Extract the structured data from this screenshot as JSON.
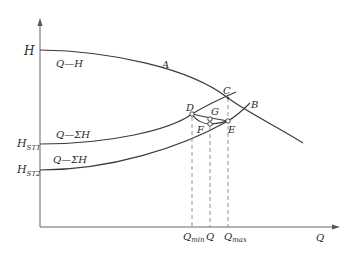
{
  "diagram": {
    "axes": {
      "y_label": "H",
      "x_label": "Q"
    },
    "y_ticks": [
      {
        "id": "h",
        "main": "H",
        "sub": ""
      },
      {
        "id": "hst1",
        "main": "H",
        "sub": "ST1"
      },
      {
        "id": "hst2",
        "main": "H",
        "sub": "ST2"
      }
    ],
    "x_ticks": [
      {
        "id": "qmin",
        "main": "Q",
        "sub": "min"
      },
      {
        "id": "q",
        "main": "Q",
        "sub": ""
      },
      {
        "id": "qmax",
        "main": "Q",
        "sub": "max"
      }
    ],
    "curves": [
      {
        "id": "pump",
        "label": "Q—H"
      },
      {
        "id": "system1",
        "label": "Q—ΣH"
      },
      {
        "id": "system2",
        "label": "Q—ΣH"
      }
    ],
    "points": {
      "A": "A",
      "B": "B",
      "C": "C",
      "D": "D",
      "E": "E",
      "F": "F",
      "G": "G"
    }
  }
}
